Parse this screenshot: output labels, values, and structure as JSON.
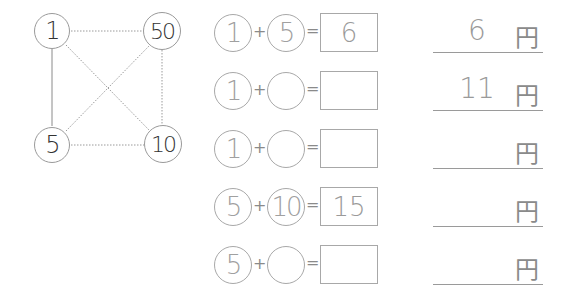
{
  "diagram": {
    "nodes": [
      {
        "id": "n1",
        "label": "1",
        "x": 52,
        "y": 31
      },
      {
        "id": "n50",
        "label": "50",
        "x": 162,
        "y": 31
      },
      {
        "id": "n5",
        "label": "5",
        "x": 52,
        "y": 145
      },
      {
        "id": "n10",
        "label": "10",
        "x": 163,
        "y": 144
      }
    ],
    "edges": [
      {
        "from": "n1",
        "to": "n5",
        "style": "solid"
      },
      {
        "from": "n1",
        "to": "n50",
        "style": "dotted"
      },
      {
        "from": "n1",
        "to": "n10",
        "style": "dotted"
      },
      {
        "from": "n5",
        "to": "n50",
        "style": "dotted"
      },
      {
        "from": "n5",
        "to": "n10",
        "style": "dotted"
      },
      {
        "from": "n50",
        "to": "n10",
        "style": "dotted"
      }
    ]
  },
  "symbols": {
    "plus": "+",
    "equals": "=",
    "yen": "円"
  },
  "rows": [
    {
      "a": "1",
      "b": "5",
      "sum": "6",
      "answer": "6"
    },
    {
      "a": "1",
      "b": "",
      "sum": "",
      "answer": "11"
    },
    {
      "a": "1",
      "b": "",
      "sum": "",
      "answer": ""
    },
    {
      "a": "5",
      "b": "10",
      "sum": "15",
      "answer": ""
    },
    {
      "a": "5",
      "b": "",
      "sum": "",
      "answer": ""
    }
  ]
}
